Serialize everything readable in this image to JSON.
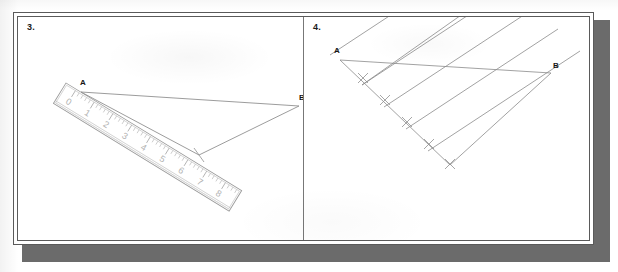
{
  "figure": {
    "type": "geometry-construction-steps",
    "panels": [
      {
        "number": "3.",
        "caption_number": "3",
        "point_a_label": "A",
        "point_b_label": "B",
        "tool": "ruler",
        "ruler_marks": [
          "0",
          "1",
          "2",
          "3",
          "4",
          "5",
          "6",
          "7",
          "8"
        ],
        "ruler_units_visible": 9,
        "ruler_minor_ticks_per_unit": 5,
        "description_points": {
          "a": {
            "x": 63,
            "y": 77
          },
          "b": {
            "x": 281,
            "y": 90
          },
          "ray_end": {
            "x": 181,
            "y": 138
          }
        }
      },
      {
        "number": "4.",
        "caption_number": "4",
        "point_a_label": "A",
        "point_b_label": "B",
        "tool": "parallels",
        "division_count": 5,
        "tick_marks": 5,
        "description_points": {
          "a": {
            "x": 36,
            "y": 43
          },
          "b": {
            "x": 247,
            "y": 55
          },
          "ray_end": {
            "x": 143,
            "y": 145
          }
        }
      }
    ]
  },
  "colors": {
    "page": "#ffffff",
    "frame_rule": "#5a5a5a",
    "drop_shadow": "#6b6b6b",
    "ink": "#7d7d7d",
    "label_ink": "#161616",
    "ruler_outline": "#9a9a9a",
    "ruler_tick": "#a0a0a0",
    "ruler_number": "#b0b0b0"
  }
}
